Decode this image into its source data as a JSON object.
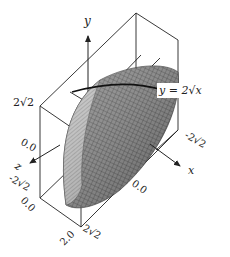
{
  "figure": {
    "type": "3d-surface-plot",
    "axes": {
      "x": {
        "label": "x",
        "ticks": [
          "-2√2",
          "0.0"
        ]
      },
      "y": {
        "label": "y",
        "ticks": [
          "2√2",
          "0.0"
        ]
      },
      "z": {
        "label": "z",
        "ticks": [
          "-2√2",
          "0.0",
          "2.0",
          "2√2"
        ]
      }
    },
    "tick_labels": {
      "y_top": "2√2",
      "y_zero": "0.0",
      "z_neg": "-2√2",
      "z_zero": "0.0",
      "z_two": "2.0",
      "z_pos": "2√2",
      "x_neg": "-2√2",
      "x_zero": "0.0"
    },
    "curve_label": "y = 2√x",
    "colors": {
      "surface_light": "#b8b8b8",
      "surface_dark": "#5a5a5a",
      "lines": "#222222",
      "background": "#ffffff"
    }
  }
}
